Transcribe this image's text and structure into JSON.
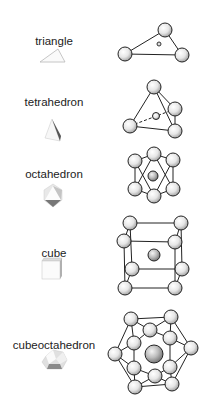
{
  "rows": [
    {
      "name": "triangle",
      "label": "triangle",
      "label_pos": [
        54,
        58
      ],
      "icon_center": [
        54,
        58
      ]
    },
    {
      "name": "tetrahedron",
      "label": "tetrahedron",
      "label_pos": [
        54,
        126
      ],
      "icon_center": [
        54,
        126
      ]
    },
    {
      "name": "octahedron",
      "label": "octahedron",
      "label_pos": [
        54,
        193
      ],
      "icon_center": [
        54,
        193
      ]
    },
    {
      "name": "cube",
      "label": "cube",
      "label_pos": [
        54,
        264
      ],
      "icon_center": [
        54,
        264
      ]
    },
    {
      "name": "cubeoctahedron",
      "label": "cubeoctahedron",
      "label_pos": [
        54,
        354
      ],
      "icon_center": [
        54,
        354
      ]
    }
  ],
  "colors": {
    "stroke": "#222222",
    "sphere_light": "#ffffff",
    "sphere_dark": "#8a8a8a",
    "text": "#222222"
  }
}
